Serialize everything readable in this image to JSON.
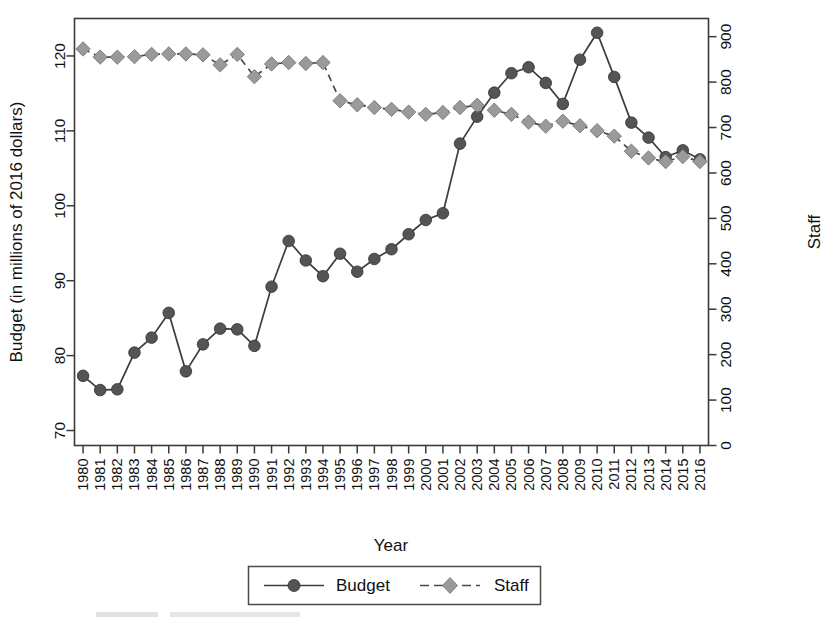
{
  "chart_data": {
    "type": "line",
    "title": "",
    "xlabel": "Year",
    "ylabel": "Budget (in millions of 2016 dollars)",
    "y2label": "Staff",
    "grid": false,
    "legend_position": "bottom",
    "x": [
      1980,
      1981,
      1982,
      1983,
      1984,
      1985,
      1986,
      1987,
      1988,
      1989,
      1990,
      1991,
      1992,
      1993,
      1994,
      1995,
      1996,
      1997,
      1998,
      1999,
      2000,
      2001,
      2002,
      2003,
      2004,
      2005,
      2006,
      2007,
      2008,
      2009,
      2010,
      2011,
      2012,
      2013,
      2014,
      2015,
      2016
    ],
    "xtick_labels": [
      "1980",
      "1981",
      "1982",
      "1983",
      "1984",
      "1985",
      "1986",
      "1987",
      "1988",
      "1989",
      "1990",
      "1991",
      "1992",
      "1993",
      "1994",
      "1995",
      "1996",
      "1997",
      "1998",
      "1999",
      "2000",
      "2001",
      "2002",
      "2003",
      "2004",
      "2005",
      "2006",
      "2007",
      "2008",
      "2009",
      "2010",
      "2011",
      "2012",
      "2013",
      "2014",
      "2015",
      "2016"
    ],
    "ylim": [
      68,
      125
    ],
    "ytick_values": [
      70,
      80,
      90,
      100,
      110,
      120
    ],
    "ytick_labels": [
      "70",
      "80",
      "90",
      "100",
      "110",
      "120"
    ],
    "y2lim": [
      0,
      940
    ],
    "y2tick_values": [
      0,
      100,
      200,
      300,
      400,
      500,
      600,
      700,
      800,
      900
    ],
    "y2tick_labels": [
      "0",
      "100",
      "200",
      "300",
      "400",
      "500",
      "600",
      "700",
      "800",
      "900"
    ],
    "series": [
      {
        "name": "Budget",
        "axis": "left",
        "marker": "circle",
        "linestyle": "solid",
        "color": "#545454",
        "values": [
          77.3,
          75.4,
          75.5,
          80.4,
          82.4,
          85.7,
          77.9,
          81.5,
          83.6,
          83.5,
          81.3,
          89.2,
          95.3,
          92.7,
          90.6,
          93.6,
          91.2,
          92.9,
          94.2,
          96.2,
          98.1,
          99.0,
          108.3,
          111.9,
          115.1,
          117.7,
          118.5,
          116.4,
          113.6,
          119.5,
          123.1,
          117.2,
          111.1,
          109.1,
          106.5,
          107.4,
          106.2
        ]
      },
      {
        "name": "Staff",
        "axis": "right",
        "marker": "diamond",
        "linestyle": "dashed",
        "color": "#9a9a9a",
        "values": [
          873,
          855,
          855,
          856,
          861,
          862,
          862,
          860,
          838,
          861,
          812,
          840,
          843,
          841,
          843,
          759,
          750,
          744,
          740,
          734,
          729,
          733,
          744,
          749,
          738,
          729,
          712,
          703,
          714,
          704,
          693,
          681,
          648,
          633,
          625,
          636,
          625
        ]
      }
    ],
    "legend": [
      {
        "label": "Budget",
        "marker": "circle",
        "linestyle": "solid"
      },
      {
        "label": "Staff",
        "marker": "diamond",
        "linestyle": "dashed"
      }
    ]
  }
}
